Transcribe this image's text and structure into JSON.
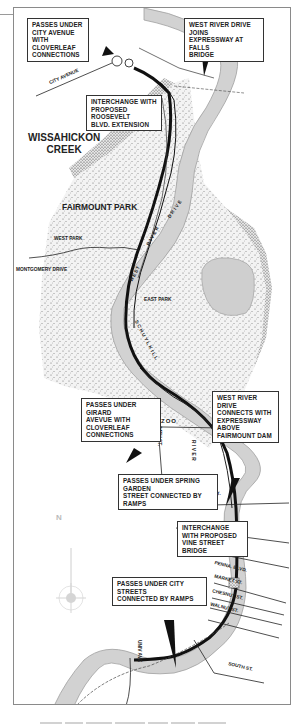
{
  "map": {
    "title_area": {
      "park_name": "FAIRMOUNT PARK",
      "creek_name": "WISSAHICKON\nCREEK",
      "creek_line1": "WISSAHICKON",
      "creek_line2": "CREEK"
    },
    "areas": {
      "west_park": "WEST PARK",
      "east_park": "EAST PARK",
      "zoo": "ZOO"
    },
    "river_labels": {
      "schuylkill": "SCHUYLKILL",
      "river": "RIVER",
      "west_river_drive_1": "WEST",
      "west_river_drive_2": "RIVER",
      "west_river_drive_3": "DRIVE"
    },
    "streets": {
      "city_avenue": "CITY AVENUE",
      "montgomery_drive": "MONTGOMERY DRIVE",
      "girard_ave": "GIRARD AVE.",
      "34th_st": "34TH ST.",
      "spring_garden_st": "SPRING GARDEN ST.",
      "penna_blvd": "PENNA. BLVD.",
      "market_st": "MARKET ST.",
      "chesnut_st": "CHESNUT ST.",
      "walnut_st": "WALNUT ST.",
      "south_st": "SOUTH ST.",
      "univ_ave": "UNIV AVE"
    },
    "callouts": [
      {
        "id": "city-avenue",
        "lines": [
          "PASSES UNDER",
          "CITY AVENUE WITH",
          "CLOVERLEAF",
          "CONNECTIONS"
        ]
      },
      {
        "id": "falls-bridge",
        "lines": [
          "WEST RIVER DRIVE JOINS",
          "EXPRESSWAY AT FALLS",
          "BRIDGE"
        ]
      },
      {
        "id": "roosevelt",
        "lines": [
          "INTERCHANGE WITH",
          "PROPOSED ROOSEVELT",
          "BLVD. EXTENSION"
        ]
      },
      {
        "id": "girard",
        "lines": [
          "PASSES UNDER GIRARD",
          "AVEVUE WITH CLOVERLEAF",
          "CONNECTIONS"
        ]
      },
      {
        "id": "fairmount-dam",
        "lines": [
          "WEST RIVER DRIVE",
          "CONNECTS WITH",
          "EXPRESSWAY ABOVE",
          "FAIRMOUNT DAM"
        ]
      },
      {
        "id": "spring-garden",
        "lines": [
          "PASSES UNDER SPRING GARDEN",
          "STREET CONNECTED BY RAMPS"
        ]
      },
      {
        "id": "vine-street",
        "lines": [
          "INTERCHANGE",
          "WITH PROPOSED",
          "VINE STREET BRIDGE"
        ]
      },
      {
        "id": "city-streets",
        "lines": [
          "PASSES UNDER CITY STREETS",
          "CONNECTED BY RAMPS"
        ]
      }
    ],
    "compass": {
      "label": "N"
    },
    "colors": {
      "river": "#d4d4d4",
      "river_edge": "#a8a8a8",
      "park_stipple": "#555555",
      "expressway": "#111111",
      "frame": "#8a8a8a"
    }
  }
}
